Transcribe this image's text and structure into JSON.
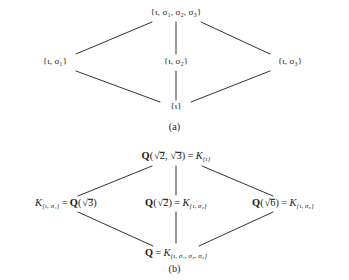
{
  "figure": {
    "kind": "galois-correspondence-lattice-pair",
    "panels": [
      {
        "id": "a",
        "caption": "(a)",
        "caption_x": 176,
        "caption_y": 126,
        "node_style": "set",
        "nodes": [
          {
            "id": "top",
            "label": "{ι, σ₁, σ₂, σ₃}",
            "parts": {
              "iota": "ι",
              "s1": "σ",
              "s1sub": "1",
              "s2": "σ",
              "s2sub": "2",
              "s3": "σ",
              "s3sub": "3"
            },
            "x": 176,
            "y": 13
          },
          {
            "id": "left",
            "label": "{ι, σ₁}",
            "parts": {
              "iota": "ι",
              "s": "σ",
              "ssub": "1"
            },
            "x": 55,
            "y": 62
          },
          {
            "id": "middle",
            "label": "{ι, σ₂}",
            "parts": {
              "iota": "ι",
              "s": "σ",
              "ssub": "2"
            },
            "x": 176,
            "y": 62
          },
          {
            "id": "right",
            "label": "{ι, σ₃}",
            "parts": {
              "iota": "ι",
              "s": "σ",
              "ssub": "3"
            },
            "x": 290,
            "y": 62
          },
          {
            "id": "bottom",
            "label": "{ι}",
            "parts": {
              "iota": "ι"
            },
            "x": 176,
            "y": 107
          }
        ],
        "edges": [
          {
            "from": "top",
            "to": "left",
            "x1": 152,
            "y1": 22,
            "x2": 76,
            "y2": 54
          },
          {
            "from": "top",
            "to": "middle",
            "x1": 176,
            "y1": 22,
            "x2": 176,
            "y2": 54
          },
          {
            "from": "top",
            "to": "right",
            "x1": 201,
            "y1": 22,
            "x2": 270,
            "y2": 54
          },
          {
            "from": "left",
            "to": "bottom",
            "x1": 76,
            "y1": 71,
            "x2": 160,
            "y2": 102
          },
          {
            "from": "middle",
            "to": "bottom",
            "x1": 176,
            "y1": 71,
            "x2": 176,
            "y2": 100
          },
          {
            "from": "right",
            "to": "bottom",
            "x1": 270,
            "y1": 71,
            "x2": 191,
            "y2": 102
          }
        ]
      },
      {
        "id": "b",
        "caption": "(b)",
        "caption_x": 176,
        "caption_y": 128,
        "node_style": "field",
        "nodes": [
          {
            "id": "top",
            "label": "Q(√2, √3) = K₍ι₎",
            "parts": {
              "Q": "Q",
              "r2": "2",
              "r3": "3",
              "eq": "=",
              "K": "K",
              "sub": "{ι}"
            },
            "x": 176,
            "y": 16
          },
          {
            "id": "left",
            "label": "K{ι, σ₁} = Q(√3)",
            "parts": {
              "K": "K",
              "sub": "{ι, σ₁}",
              "eq": "=",
              "Q": "Q",
              "r": "3"
            },
            "x": 66,
            "y": 63
          },
          {
            "id": "middle",
            "label": "Q(√2) = K{ι, σ₂}",
            "parts": {
              "Q": "Q",
              "r": "2",
              "eq": "=",
              "K": "K",
              "sub": "{ι, σ₂}"
            },
            "x": 176,
            "y": 63
          },
          {
            "id": "right",
            "label": "Q(√6) = K{ι, σ₃}",
            "parts": {
              "Q": "Q",
              "r": "6",
              "eq": "=",
              "K": "K",
              "sub": "{ι, σ₃}"
            },
            "x": 283,
            "y": 63
          },
          {
            "id": "bottom",
            "label": "Q = K{ι, σ₁, σ₂, σ₃}",
            "parts": {
              "Q": "Q",
              "eq": "=",
              "K": "K",
              "sub": "{ι, σ₁, σ₂, σ₃}"
            },
            "x": 176,
            "y": 113
          }
        ],
        "edges": [
          {
            "from": "top",
            "to": "left",
            "x1": 152,
            "y1": 26,
            "x2": 78,
            "y2": 56
          },
          {
            "from": "top",
            "to": "middle",
            "x1": 176,
            "y1": 26,
            "x2": 176,
            "y2": 55
          },
          {
            "from": "top",
            "to": "right",
            "x1": 202,
            "y1": 26,
            "x2": 273,
            "y2": 56
          },
          {
            "from": "left",
            "to": "bottom",
            "x1": 78,
            "y1": 72,
            "x2": 153,
            "y2": 106
          },
          {
            "from": "middle",
            "to": "bottom",
            "x1": 176,
            "y1": 72,
            "x2": 176,
            "y2": 103
          },
          {
            "from": "right",
            "to": "bottom",
            "x1": 273,
            "y1": 72,
            "x2": 199,
            "y2": 106
          }
        ]
      }
    ],
    "symbols": {
      "iota": "ι",
      "sigma": "σ",
      "radical": "√",
      "brace_open": "{",
      "brace_close": "}",
      "equals": "=",
      "comma": ","
    },
    "colors": {
      "background": "#ffffff",
      "ink": "#1a1a1a",
      "edge": "#1b1b1b"
    }
  }
}
